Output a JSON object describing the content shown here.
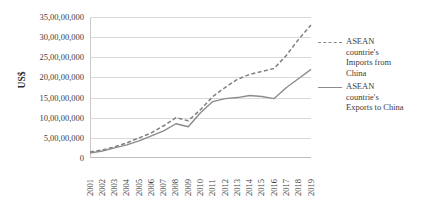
{
  "chart_data": {
    "type": "line",
    "title": "",
    "xlabel": "",
    "ylabel": "US$",
    "categories": [
      "2001",
      "2002",
      "2003",
      "2004",
      "2005",
      "2006",
      "2007",
      "2008",
      "2009",
      "2010",
      "2011",
      "2012",
      "2013",
      "2014",
      "2015",
      "2016",
      "2017",
      "2018",
      "2019"
    ],
    "ylim": [
      0,
      350000000
    ],
    "ytick_labels": [
      "0",
      "5,00,00,000",
      "10,00,00,000",
      "15,00,00,000",
      "20,00,00,000",
      "25,00,00,000",
      "30,00,00,000",
      "35,00,00,000"
    ],
    "ytick_values": [
      0,
      50000000,
      100000000,
      150000000,
      200000000,
      250000000,
      300000000,
      350000000
    ],
    "grid": true,
    "legend_position": "right",
    "series": [
      {
        "name": "ASEAN countrie's Imports from China",
        "style": "dashed",
        "color": "#808080",
        "values": [
          15000000,
          20000000,
          27500000,
          37500000,
          50000000,
          62500000,
          80000000,
          100000000,
          92500000,
          120000000,
          152500000,
          175000000,
          195000000,
          207500000,
          215000000,
          222500000,
          255000000,
          295000000,
          330000000
        ]
      },
      {
        "name": "ASEAN countrie's Exports to China",
        "style": "solid",
        "color": "#8c8c8c",
        "values": [
          12500000,
          17500000,
          25000000,
          32500000,
          42500000,
          55000000,
          67500000,
          85000000,
          77500000,
          112500000,
          140000000,
          147500000,
          150000000,
          155000000,
          152500000,
          147500000,
          175000000,
          197500000,
          220000000
        ]
      }
    ]
  },
  "legend": {
    "entries": [
      {
        "label": "ASEAN countrie's Imports from China",
        "style": "dashed"
      },
      {
        "label": "ASEAN countrie's Exports to China",
        "style": "solid"
      }
    ]
  }
}
